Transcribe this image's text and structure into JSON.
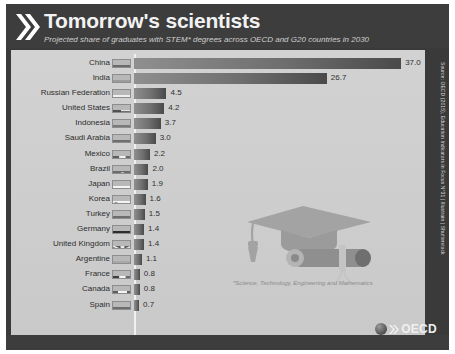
{
  "header": {
    "title": "Tomorrow's scientists",
    "subtitle": "Projected share of graduates with STEM* degrees across OECD and G20 countries in 2030",
    "chevron_icon": "double-chevron-right-icon"
  },
  "footnote": "*Science, Technology, Engineering and Mathematics",
  "source": "Source: OECD (2015), Education Indicators in Focus N°31 | Illustrain | Shutterstock",
  "brand": {
    "name": "OECD",
    "globe_icon": "globe-icon",
    "chevron_icon": "double-chevron-right-icon"
  },
  "illustration": {
    "name": "graduation-cap-and-diploma-illustration"
  },
  "chart_data": {
    "type": "bar",
    "orientation": "horizontal",
    "title": "Tomorrow's scientists",
    "subtitle": "Projected share of graduates with STEM* degrees across OECD and G20 countries in 2030",
    "xlabel": "",
    "ylabel": "",
    "xlim": [
      0,
      37
    ],
    "grid": false,
    "legend": false,
    "value_labels": true,
    "units": "percent share of STEM graduates",
    "categories": [
      "China",
      "India",
      "Russian Federation",
      "United States",
      "Indonesia",
      "Saudi Arabia",
      "Mexico",
      "Brazil",
      "Japan",
      "Korea",
      "Turkey",
      "Germany",
      "United Kingdom",
      "Argentine",
      "France",
      "Canada",
      "Spain",
      "Others"
    ],
    "values": [
      37.0,
      26.7,
      4.5,
      4.2,
      3.7,
      3.0,
      2.2,
      2.0,
      1.9,
      1.6,
      1.5,
      1.4,
      1.4,
      1.1,
      0.8,
      0.8,
      0.7,
      5.6
    ],
    "value_text": [
      "37.0",
      "26.7",
      "4.5",
      "4.2",
      "3.7",
      "3.0",
      "2.2",
      "2.0",
      "1.9",
      "1.6",
      "1.5",
      "1.4",
      "1.4",
      "1.1",
      "0.8",
      "0.8",
      "0.7",
      "5.6"
    ]
  },
  "rows": [
    {
      "label": "China",
      "value": "37.0",
      "flag": "flag-china-icon",
      "v": 37.0
    },
    {
      "label": "India",
      "value": "26.7",
      "flag": "flag-india-icon",
      "v": 26.7
    },
    {
      "label": "Russian Federation",
      "value": "4.5",
      "flag": "flag-russia-icon",
      "v": 4.5
    },
    {
      "label": "United States",
      "value": "4.2",
      "flag": "flag-united-states-icon",
      "v": 4.2
    },
    {
      "label": "Indonesia",
      "value": "3.7",
      "flag": "flag-indonesia-icon",
      "v": 3.7
    },
    {
      "label": "Saudi Arabia",
      "value": "3.0",
      "flag": "flag-saudi-arabia-icon",
      "v": 3.0
    },
    {
      "label": "Mexico",
      "value": "2.2",
      "flag": "flag-mexico-icon",
      "v": 2.2
    },
    {
      "label": "Brazil",
      "value": "2.0",
      "flag": "flag-brazil-icon",
      "v": 2.0
    },
    {
      "label": "Japan",
      "value": "1.9",
      "flag": "flag-japan-icon",
      "v": 1.9
    },
    {
      "label": "Korea",
      "value": "1.6",
      "flag": "flag-korea-icon",
      "v": 1.6
    },
    {
      "label": "Turkey",
      "value": "1.5",
      "flag": "flag-turkey-icon",
      "v": 1.5
    },
    {
      "label": "Germany",
      "value": "1.4",
      "flag": "flag-germany-icon",
      "v": 1.4
    },
    {
      "label": "United Kingdom",
      "value": "1.4",
      "flag": "flag-united-kingdom-icon",
      "v": 1.4
    },
    {
      "label": "Argentine",
      "value": "1.1",
      "flag": "flag-argentina-icon",
      "v": 1.1
    },
    {
      "label": "France",
      "value": "0.8",
      "flag": "flag-france-icon",
      "v": 0.8
    },
    {
      "label": "Canada",
      "value": "0.8",
      "flag": "flag-canada-icon",
      "v": 0.8
    },
    {
      "label": "Spain",
      "value": "0.7",
      "flag": "flag-spain-icon",
      "v": 0.7
    },
    {
      "label": "Others",
      "value": "5.6",
      "flag": "",
      "v": 5.6,
      "spacer": true
    }
  ]
}
